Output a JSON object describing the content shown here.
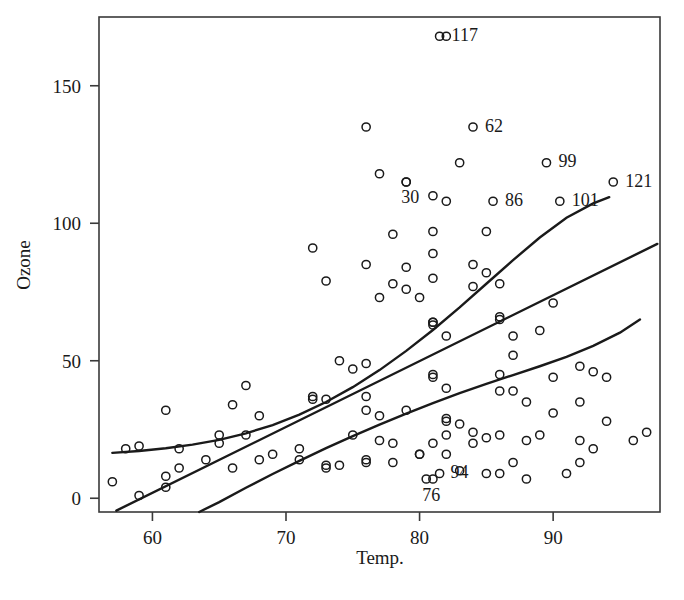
{
  "chart_data": {
    "type": "scatter",
    "title": "",
    "xlabel": "Temp.",
    "ylabel": "Ozone",
    "xlim": [
      56.0,
      98.0
    ],
    "ylim": [
      -5.0,
      175.0
    ],
    "grid": false,
    "legend": null,
    "xticks": [
      60,
      70,
      80,
      90
    ],
    "xtick_labels": [
      "60",
      "70",
      "80",
      "90"
    ],
    "yticks": [
      0,
      50,
      100,
      150
    ],
    "ytick_labels": [
      "0",
      "50",
      "100",
      "150"
    ],
    "marker": "open-circle",
    "points": [
      {
        "x": 67,
        "y": 41
      },
      {
        "x": 72,
        "y": 36
      },
      {
        "x": 74,
        "y": 12
      },
      {
        "x": 62,
        "y": 18
      },
      {
        "x": 65,
        "y": 23
      },
      {
        "x": 59,
        "y": 19
      },
      {
        "x": 61,
        "y": 8
      },
      {
        "x": 69,
        "y": 16
      },
      {
        "x": 66,
        "y": 11
      },
      {
        "x": 68,
        "y": 14
      },
      {
        "x": 58,
        "y": 18
      },
      {
        "x": 64,
        "y": 14
      },
      {
        "x": 66,
        "y": 34
      },
      {
        "x": 57,
        "y": 6
      },
      {
        "x": 68,
        "y": 30
      },
      {
        "x": 62,
        "y": 11
      },
      {
        "x": 59,
        "y": 1
      },
      {
        "x": 73,
        "y": 11
      },
      {
        "x": 61,
        "y": 4
      },
      {
        "x": 61,
        "y": 32
      },
      {
        "x": 67,
        "y": 23
      },
      {
        "x": 81,
        "y": 45
      },
      {
        "x": 79,
        "y": 115
      },
      {
        "x": 76,
        "y": 37
      },
      {
        "x": 82,
        "y": 29
      },
      {
        "x": 90,
        "y": 71
      },
      {
        "x": 87,
        "y": 39
      },
      {
        "x": 82,
        "y": 23
      },
      {
        "x": 77,
        "y": 21
      },
      {
        "x": 72,
        "y": 37
      },
      {
        "x": 65,
        "y": 20
      },
      {
        "x": 73,
        "y": 12
      },
      {
        "x": 76,
        "y": 13
      },
      {
        "x": 76,
        "y": 135
      },
      {
        "x": 76,
        "y": 49
      },
      {
        "x": 76,
        "y": 32
      },
      {
        "x": 81,
        "y": 64
      },
      {
        "x": 82,
        "y": 40
      },
      {
        "x": 84,
        "y": 77
      },
      {
        "x": 85,
        "y": 97
      },
      {
        "x": 81,
        "y": 97
      },
      {
        "x": 84,
        "y": 85
      },
      {
        "x": 83,
        "y": 10
      },
      {
        "x": 83,
        "y": 27
      },
      {
        "x": 88,
        "y": 7
      },
      {
        "x": 92,
        "y": 48
      },
      {
        "x": 92,
        "y": 35
      },
      {
        "x": 89,
        "y": 61
      },
      {
        "x": 73,
        "y": 79
      },
      {
        "x": 81,
        "y": 63
      },
      {
        "x": 80,
        "y": 16
      },
      {
        "x": 81,
        "y": 80
      },
      {
        "x": 82,
        "y": 108
      },
      {
        "x": 84,
        "y": 20
      },
      {
        "x": 87,
        "y": 52
      },
      {
        "x": 85,
        "y": 82
      },
      {
        "x": 74,
        "y": 50
      },
      {
        "x": 81,
        "y": 64
      },
      {
        "x": 82,
        "y": 59
      },
      {
        "x": 86,
        "y": 39
      },
      {
        "x": 85,
        "y": 9
      },
      {
        "x": 82,
        "y": 16
      },
      {
        "x": 86,
        "y": 78
      },
      {
        "x": 88,
        "y": 35
      },
      {
        "x": 86,
        "y": 66
      },
      {
        "x": 83,
        "y": 122
      },
      {
        "x": 81,
        "y": 89
      },
      {
        "x": 81,
        "y": 110
      },
      {
        "x": 81,
        "y": 44
      },
      {
        "x": 82,
        "y": 28
      },
      {
        "x": 86,
        "y": 65
      },
      {
        "x": 85,
        "y": 22
      },
      {
        "x": 87,
        "y": 59
      },
      {
        "x": 89,
        "y": 23
      },
      {
        "x": 90,
        "y": 31
      },
      {
        "x": 90,
        "y": 44
      },
      {
        "x": 92,
        "y": 21
      },
      {
        "x": 86,
        "y": 9
      },
      {
        "x": 86,
        "y": 45
      },
      {
        "x": 82,
        "y": 168
      },
      {
        "x": 80,
        "y": 73
      },
      {
        "x": 79,
        "y": 76
      },
      {
        "x": 77,
        "y": 118
      },
      {
        "x": 79,
        "y": 84
      },
      {
        "x": 76,
        "y": 85
      },
      {
        "x": 78,
        "y": 96
      },
      {
        "x": 78,
        "y": 78
      },
      {
        "x": 77,
        "y": 73
      },
      {
        "x": 72,
        "y": 91
      },
      {
        "x": 75,
        "y": 47
      },
      {
        "x": 79,
        "y": 32
      },
      {
        "x": 81,
        "y": 20
      },
      {
        "x": 86,
        "y": 23
      },
      {
        "x": 88,
        "y": 21
      },
      {
        "x": 97,
        "y": 24
      },
      {
        "x": 94,
        "y": 44
      },
      {
        "x": 96,
        "y": 21
      },
      {
        "x": 94,
        "y": 28
      },
      {
        "x": 91,
        "y": 9
      },
      {
        "x": 92,
        "y": 13
      },
      {
        "x": 93,
        "y": 46
      },
      {
        "x": 93,
        "y": 18
      },
      {
        "x": 87,
        "y": 13
      },
      {
        "x": 84,
        "y": 24
      },
      {
        "x": 80,
        "y": 16
      },
      {
        "x": 78,
        "y": 13
      },
      {
        "x": 75,
        "y": 23
      },
      {
        "x": 73,
        "y": 36
      },
      {
        "x": 81,
        "y": 7
      },
      {
        "x": 76,
        "y": 14
      },
      {
        "x": 77,
        "y": 30
      },
      {
        "x": 71,
        "y": 14
      },
      {
        "x": 71,
        "y": 18
      },
      {
        "x": 78,
        "y": 20
      }
    ],
    "labeled_points": [
      {
        "label": "117",
        "x": 81.5,
        "y": 168,
        "label_dx": 12,
        "label_dy": 5
      },
      {
        "label": "62",
        "x": 84.0,
        "y": 135,
        "label_dx": 12,
        "label_dy": 5
      },
      {
        "label": "99",
        "x": 89.5,
        "y": 122,
        "label_dx": 12,
        "label_dy": 4
      },
      {
        "label": "121",
        "x": 94.5,
        "y": 115,
        "label_dx": 12,
        "label_dy": 5
      },
      {
        "label": "30",
        "x": 79.0,
        "y": 115,
        "label_dx": -5,
        "label_dy": 21
      },
      {
        "label": "86",
        "x": 85.5,
        "y": 108,
        "label_dx": 12,
        "label_dy": 5
      },
      {
        "label": "101",
        "x": 90.5,
        "y": 108,
        "label_dx": 12,
        "label_dy": 5
      },
      {
        "label": "94",
        "x": 81.5,
        "y": 9,
        "label_dx": 11,
        "label_dy": 4
      },
      {
        "label": "76",
        "x": 80.5,
        "y": 7,
        "label_dx": -4,
        "label_dy": 22
      }
    ],
    "fit_curves": [
      {
        "name": "upper-quantile-curve",
        "points": [
          [
            57.0,
            16.5
          ],
          [
            59.0,
            17.2
          ],
          [
            61.0,
            18.2
          ],
          [
            63.0,
            19.5
          ],
          [
            65.0,
            21.2
          ],
          [
            67.0,
            23.6
          ],
          [
            69.0,
            26.6
          ],
          [
            71.0,
            30.4
          ],
          [
            73.0,
            35.0
          ],
          [
            75.0,
            40.4
          ],
          [
            77.0,
            46.6
          ],
          [
            79.0,
            53.6
          ],
          [
            81.0,
            61.2
          ],
          [
            83.0,
            69.4
          ],
          [
            85.0,
            78.0
          ],
          [
            87.0,
            86.6
          ],
          [
            89.0,
            94.8
          ],
          [
            91.0,
            102.0
          ],
          [
            93.0,
            107.2
          ],
          [
            94.2,
            109.5
          ]
        ]
      },
      {
        "name": "median-line",
        "points": [
          [
            57.3,
            -4.5
          ],
          [
            97.8,
            92.5
          ]
        ]
      },
      {
        "name": "lower-quantile-curve",
        "points": [
          [
            63.5,
            -5.0
          ],
          [
            65.0,
            -1.4
          ],
          [
            67.0,
            3.8
          ],
          [
            69.0,
            8.8
          ],
          [
            71.0,
            13.6
          ],
          [
            73.0,
            18.2
          ],
          [
            75.0,
            22.6
          ],
          [
            77.0,
            26.8
          ],
          [
            79.0,
            30.8
          ],
          [
            81.0,
            34.6
          ],
          [
            83.0,
            38.2
          ],
          [
            85.0,
            41.6
          ],
          [
            87.0,
            44.8
          ],
          [
            89.0,
            48.0
          ],
          [
            91.0,
            51.4
          ],
          [
            93.0,
            55.4
          ],
          [
            95.0,
            60.2
          ],
          [
            96.5,
            65.0
          ]
        ]
      }
    ]
  },
  "colors": {
    "axis": "#3a3a3a",
    "curve": "#1a1a1a",
    "point": "#1a1a1a",
    "text": "#1a1a1a",
    "background": "#ffffff"
  }
}
